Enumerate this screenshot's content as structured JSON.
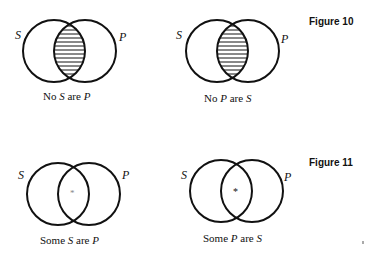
{
  "figures": [
    {
      "label": "Figure 10",
      "diagrams": [
        {
          "caption": {
            "w1": "No",
            "a": "S",
            "w2": "are",
            "b": "P"
          },
          "left_set": "S",
          "right_set": "P",
          "intersection": "shaded",
          "geometry": {
            "lcx": 54,
            "rcx": 85,
            "cy": 51,
            "r": 31
          }
        },
        {
          "caption": {
            "w1": "No",
            "a": "P",
            "w2": "are",
            "b": "S"
          },
          "left_set": "S",
          "right_set": "P",
          "intersection": "shaded",
          "geometry": {
            "lcx": 217,
            "rcx": 248,
            "cy": 51,
            "r": 31
          }
        }
      ]
    },
    {
      "label": "Figure 11",
      "diagrams": [
        {
          "caption": {
            "w1": "Some",
            "a": "S",
            "w2": "are",
            "b": "P"
          },
          "left_set": "S",
          "right_set": "P",
          "intersection": "asterisk",
          "mark": "*",
          "geometry": {
            "lcx": 58,
            "rcx": 89,
            "cy": 194,
            "r": 31
          }
        },
        {
          "caption": {
            "w1": "Some",
            "a": "P",
            "w2": "are",
            "b": "S"
          },
          "left_set": "S",
          "right_set": "P",
          "intersection": "asterisk",
          "mark": "*",
          "geometry": {
            "lcx": 221,
            "rcx": 252,
            "cy": 191,
            "r": 31
          }
        }
      ]
    }
  ],
  "colors": {
    "ink": "#111111",
    "background": "#ffffff"
  }
}
